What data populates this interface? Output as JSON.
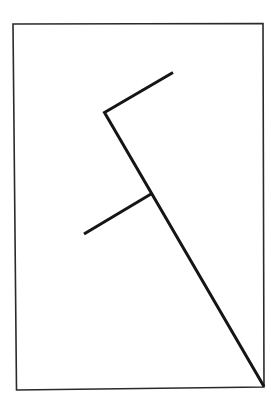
{
  "diagram": {
    "type": "line-figure",
    "canvas": {
      "width": 271,
      "height": 404,
      "background": "#ffffff"
    },
    "frame": {
      "points": [
        [
          13,
          24
        ],
        [
          263,
          23.5
        ],
        [
          264,
          387
        ],
        [
          16.5,
          390
        ]
      ],
      "stroke": "#2a2a2a",
      "stroke_width": 1.6
    },
    "strokes": [
      {
        "id": "main-path",
        "points": [
          [
            173,
            72.5
          ],
          [
            104.5,
            112.5
          ],
          [
            264,
            386.5
          ]
        ],
        "stroke": "#151515",
        "stroke_width": 3
      },
      {
        "id": "branch",
        "points": [
          [
            151,
            194
          ],
          [
            84,
            234
          ]
        ],
        "stroke": "#151515",
        "stroke_width": 3
      }
    ]
  }
}
